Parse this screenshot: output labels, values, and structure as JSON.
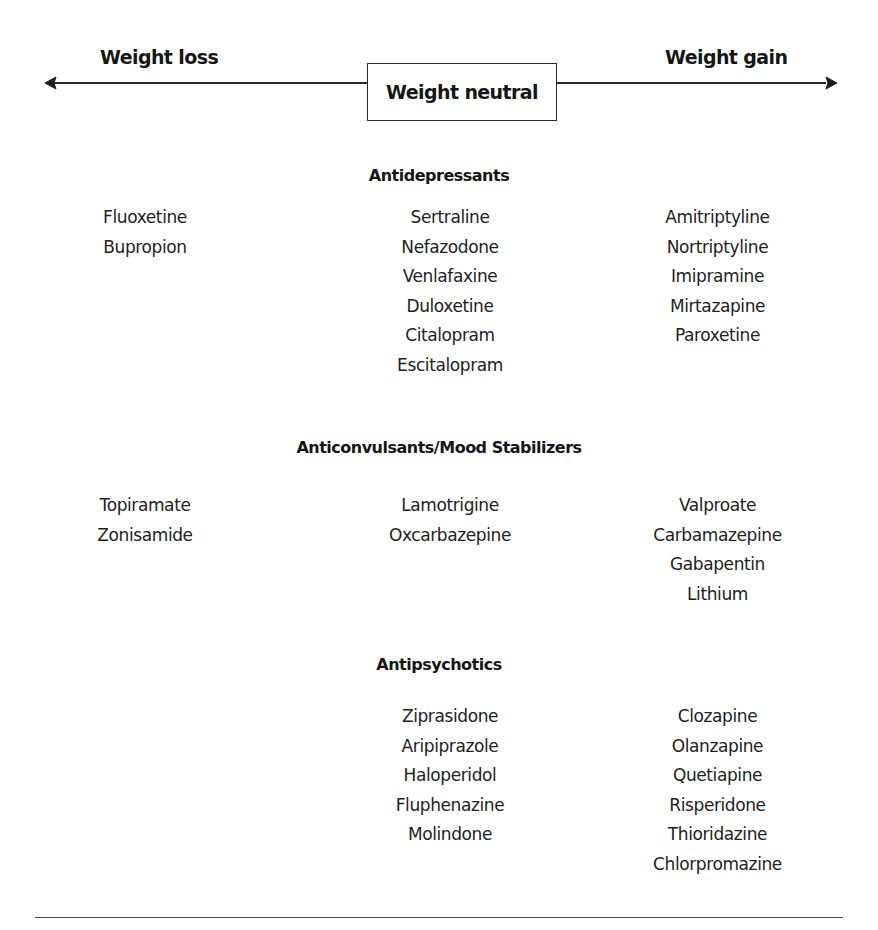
{
  "axis": {
    "left_label": "Weight loss",
    "center_label": "Weight neutral",
    "right_label": "Weight gain"
  },
  "sections": [
    {
      "title": "Antidepressants",
      "weight_loss": [
        "Fluoxetine",
        "Bupropion"
      ],
      "weight_neutral": [
        "Sertraline",
        "Nefazodone",
        "Venlafaxine",
        "Duloxetine",
        "Citalopram",
        "Escitalopram"
      ],
      "weight_gain": [
        "Amitriptyline",
        "Nortriptyline",
        "Imipramine",
        "Mirtazapine",
        "Paroxetine"
      ]
    },
    {
      "title": "Anticonvulsants/Mood Stabilizers",
      "weight_loss": [
        "Topiramate",
        "Zonisamide"
      ],
      "weight_neutral": [
        "Lamotrigine",
        "Oxcarbazepine"
      ],
      "weight_gain": [
        "Valproate",
        "Carbamazepine",
        "Gabapentin",
        "Lithium"
      ]
    },
    {
      "title": "Antipsychotics",
      "weight_loss": [],
      "weight_neutral": [
        "Ziprasidone",
        "Aripiprazole",
        "Haloperidol",
        "Fluphenazine",
        "Molindone"
      ],
      "weight_gain": [
        "Clozapine",
        "Olanzapine",
        "Quetiapine",
        "Risperidone",
        "Thioridazine",
        "Chlorpromazine"
      ]
    }
  ],
  "colors": {
    "text": "#1e1e1e",
    "lines": "#2a2a2a",
    "background": "#ffffff"
  }
}
